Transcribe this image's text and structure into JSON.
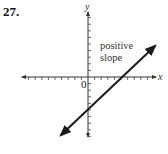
{
  "problem": {
    "number": "27."
  },
  "chart_data": {
    "type": "line",
    "title": "",
    "xlabel": "x",
    "ylabel": "y",
    "origin_label": "0",
    "annotation": [
      "positive",
      "slope"
    ],
    "grid": false,
    "ticks": {
      "x_left": 9,
      "x_right": 9,
      "y_up": 9,
      "y_down": 9,
      "tick_labels": false
    },
    "series": [
      {
        "name": "line",
        "description": "straight line with arrows at both ends, positive slope, negative y-intercept, positive x-intercept",
        "x": [
          -4,
          8
        ],
        "y": [
          -9,
          4.5
        ]
      }
    ],
    "approx_intercepts": {
      "x_intercept": 5,
      "y_intercept": -5
    },
    "colors": {
      "axes": "#333333",
      "line": "#1a1a1a"
    }
  }
}
